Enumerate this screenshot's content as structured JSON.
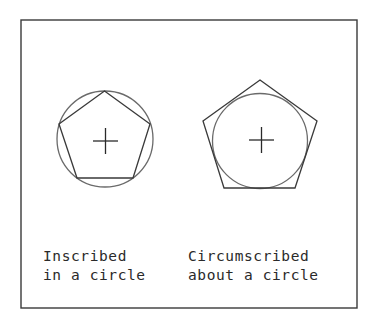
{
  "figures": [
    {
      "id": "inscribed",
      "caption_line1": "Inscribed",
      "caption_line2": "in a circle"
    },
    {
      "id": "circumscribed",
      "caption_line1": "Circumscribed",
      "caption_line2": "about a circle"
    }
  ],
  "colors": {
    "stroke": "#3a3a3a",
    "circle": "#6a6a6a",
    "background": "#ffffff"
  }
}
